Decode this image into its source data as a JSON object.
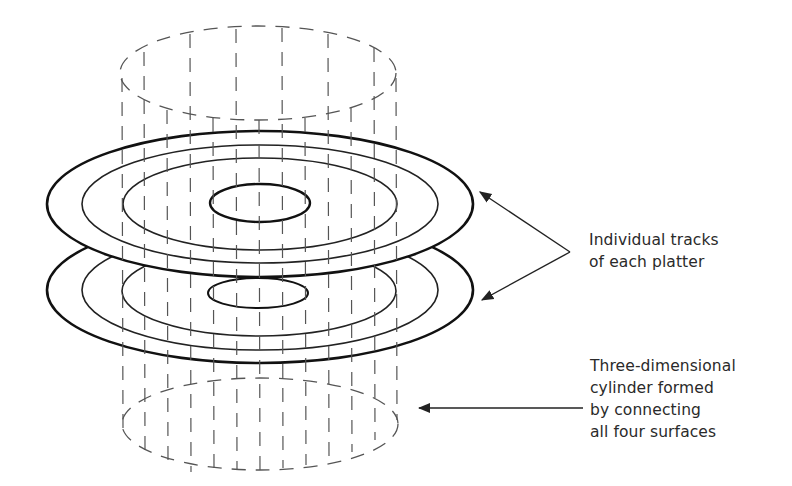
{
  "figure": {
    "type": "disk-geometry-diagram",
    "colors": {
      "background": "#ffffff",
      "line": "#1a1a1a",
      "dash": "#555555",
      "text": "#2a2a2a"
    }
  },
  "callouts": {
    "tracks": {
      "lines": [
        "Individual tracks",
        "of each platter"
      ]
    },
    "cylinder": {
      "lines": [
        "Three-dimensional",
        "cylinder formed",
        "by connecting",
        "all four surfaces"
      ]
    }
  },
  "geometry": {
    "platters": [
      {
        "name": "top-platter",
        "cx": 260,
        "cy": 204,
        "tracks_rx": [
          213,
          178,
          137
        ],
        "tracks_ry": [
          73,
          59,
          46
        ],
        "hub_rx": 50,
        "hub_ry": 19
      },
      {
        "name": "bottom-platter",
        "cx": 260,
        "cy": 290,
        "tracks_rx": [
          213,
          178,
          137
        ],
        "tracks_ry": [
          73,
          59,
          46
        ],
        "hub_rx": 50,
        "hub_ry": 15
      }
    ],
    "cylinder": {
      "top": {
        "cx": 258,
        "cy": 73,
        "rx": 138,
        "ry": 47
      },
      "bottom": {
        "cx": 260,
        "cy": 424,
        "rx": 138,
        "ry": 46
      }
    }
  }
}
